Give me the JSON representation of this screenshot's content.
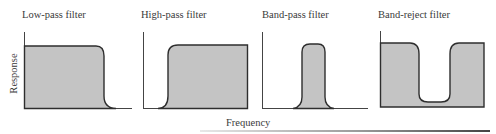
{
  "figure": {
    "y_axis_label": "Response",
    "x_axis_label": "Frequency",
    "fill_color": "#c4c4c4",
    "stroke_color": "#2e2e2e",
    "panels": [
      {
        "title": "Low-pass filter",
        "shape": "passes low frequencies, cuts off high"
      },
      {
        "title": "High-pass filter",
        "shape": "blocks low frequencies, passes high"
      },
      {
        "title": "Band-pass filter",
        "shape": "passes a narrow middle band"
      },
      {
        "title": "Band-reject filter",
        "shape": "passes all except a narrow middle band"
      }
    ]
  }
}
